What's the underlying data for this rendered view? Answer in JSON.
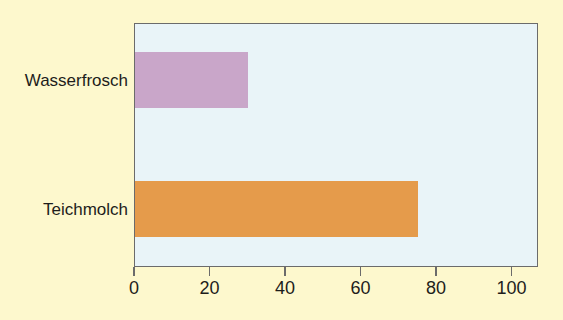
{
  "chart_data": {
    "type": "bar",
    "orientation": "horizontal",
    "title": "",
    "subtitle": "",
    "xlabel": "",
    "ylabel": "",
    "categories": [
      "Wasserfrosch",
      "Teichmolch"
    ],
    "values": [
      30,
      75
    ],
    "series": [
      {
        "name": "",
        "values": [
          30,
          75
        ],
        "colors": [
          "#c9a6c9",
          "#e59b4b"
        ]
      }
    ],
    "xlim": [
      0,
      107
    ],
    "xticks": [
      0,
      20,
      40,
      60,
      80,
      100
    ],
    "xtick_labels": [
      "0",
      "20",
      "40",
      "60",
      "80",
      "100"
    ],
    "grid": false,
    "legend": null,
    "legend_position": "none",
    "annotations": []
  },
  "style": {
    "page_background": "#fdf8cd",
    "plot_background": "#e9f4f8",
    "axis_color": "#6b6b6b",
    "text_color": "#1d1d1b",
    "bar_color_1": "#c9a6c9",
    "bar_color_2": "#e59b4b"
  }
}
